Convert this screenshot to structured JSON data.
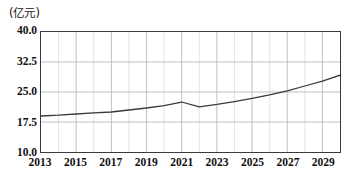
{
  "chart_data": {
    "type": "line",
    "title": "",
    "subtitle": "",
    "unit_label": "(亿元)",
    "xlabel": "",
    "ylabel": "",
    "ylim": [
      10.0,
      40.0
    ],
    "xlim": [
      2013,
      2030
    ],
    "y_ticks": [
      "40.0",
      "32.5",
      "25.0",
      "17.5",
      "10.0"
    ],
    "y_tick_values": [
      40.0,
      32.5,
      25.0,
      17.5,
      10.0
    ],
    "x_ticks": [
      "2013",
      "2015",
      "2017",
      "2019",
      "2021",
      "2023",
      "2025",
      "2027",
      "2029"
    ],
    "x_tick_values": [
      2013,
      2015,
      2017,
      2019,
      2021,
      2023,
      2025,
      2027,
      2029
    ],
    "grid": true,
    "grid_x_step": 1,
    "legend": "none",
    "line_color": "#3a3a3a",
    "grid_color": "#b4b4b4",
    "frame_color": "#3a3a3a",
    "x": [
      2013,
      2014,
      2015,
      2016,
      2017,
      2018,
      2019,
      2020,
      2021,
      2022,
      2023,
      2024,
      2025,
      2026,
      2027,
      2028,
      2029,
      2030
    ],
    "values": [
      19.0,
      19.2,
      19.5,
      19.8,
      20.0,
      20.5,
      21.0,
      21.6,
      22.5,
      21.3,
      21.9,
      22.6,
      23.4,
      24.3,
      25.3,
      26.5,
      27.7,
      29.2
    ],
    "series": [
      {
        "name": "",
        "values": [
          19.0,
          19.2,
          19.5,
          19.8,
          20.0,
          20.5,
          21.0,
          21.6,
          22.5,
          21.3,
          21.9,
          22.6,
          23.4,
          24.3,
          25.3,
          26.5,
          27.7,
          29.2
        ]
      }
    ]
  }
}
